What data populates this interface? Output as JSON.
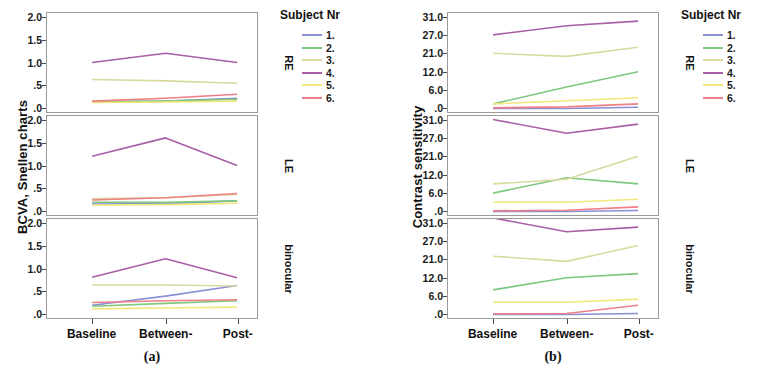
{
  "figure": {
    "panels": [
      {
        "id": "a",
        "caption": "(a)",
        "ylabel": "BCVA, Snellen charts",
        "legend_title": "Subject Nr"
      },
      {
        "id": "b",
        "caption": "(b)",
        "ylabel": "Contrast sensitivity",
        "legend_title": "Subject Nr"
      }
    ],
    "row_labels": [
      "RE",
      "LE",
      "binocular"
    ],
    "x_categories": [
      "Baseline",
      "Between-",
      "Post-"
    ],
    "legend_entries": [
      {
        "label": "1.",
        "color": "#8a8fd6"
      },
      {
        "label": "2.",
        "color": "#7ec87e"
      },
      {
        "label": "3.",
        "color": "#d9d9a0"
      },
      {
        "label": "4.",
        "color": "#a濾"
      },
      {
        "label": "5.",
        "color": "#f0e87a"
      },
      {
        "label": "6.",
        "color": "#ef7f86"
      }
    ]
  },
  "chart_data": [
    {
      "id": "a",
      "type": "line",
      "title": "(a)",
      "xlabel": "",
      "ylabel": "BCVA, Snellen charts",
      "x": [
        "Baseline",
        "Between-",
        "Post-"
      ],
      "yticks": [
        0,
        0.5,
        1.0,
        1.5,
        2.0
      ],
      "yticklabels": [
        ".0",
        ".5",
        "1.0",
        "1.5",
        "2.0"
      ],
      "ylim": [
        0,
        2.2
      ],
      "grid": false,
      "legend_position": "right",
      "legend_title": "Subject Nr",
      "facets": [
        {
          "name": "RE",
          "series": [
            {
              "name": "1.",
              "color": "#8a8fd6",
              "values": [
                0.14,
                0.16,
                0.22
              ]
            },
            {
              "name": "2.",
              "color": "#7ec87e",
              "values": [
                0.15,
                0.16,
                0.2
              ]
            },
            {
              "name": "3.",
              "color": "#d9d9a0",
              "values": [
                0.63,
                0.6,
                0.55
              ]
            },
            {
              "name": "4.",
              "color": "#a85fa8",
              "values": [
                1.0,
                1.2,
                1.0
              ]
            },
            {
              "name": "5.",
              "color": "#f0e87a",
              "values": [
                0.13,
                0.14,
                0.16
              ]
            },
            {
              "name": "6.",
              "color": "#ef7f86",
              "values": [
                0.16,
                0.22,
                0.31
              ]
            }
          ]
        },
        {
          "name": "LE",
          "series": [
            {
              "name": "1.",
              "color": "#8a8fd6",
              "values": [
                0.16,
                0.17,
                0.23
              ]
            },
            {
              "name": "2.",
              "color": "#7ec87e",
              "values": [
                0.2,
                0.2,
                0.23
              ]
            },
            {
              "name": "3.",
              "color": "#d9d9a0",
              "values": [
                0.28,
                0.3,
                0.37
              ]
            },
            {
              "name": "4.",
              "color": "#a85fa8",
              "values": [
                1.2,
                1.6,
                1.0
              ]
            },
            {
              "name": "5.",
              "color": "#f0e87a",
              "values": [
                0.14,
                0.15,
                0.18
              ]
            },
            {
              "name": "6.",
              "color": "#ef7f86",
              "values": [
                0.25,
                0.3,
                0.39
              ]
            }
          ]
        },
        {
          "name": "binocular",
          "series": [
            {
              "name": "1.",
              "color": "#8a8fd6",
              "values": [
                0.2,
                0.4,
                0.63
              ]
            },
            {
              "name": "2.",
              "color": "#7ec87e",
              "values": [
                0.18,
                0.24,
                0.3
              ]
            },
            {
              "name": "3.",
              "color": "#d9d9a0",
              "values": [
                0.64,
                0.64,
                0.62
              ]
            },
            {
              "name": "4.",
              "color": "#a85fa8",
              "values": [
                0.81,
                1.21,
                0.8
              ]
            },
            {
              "name": "5.",
              "color": "#f0e87a",
              "values": [
                0.12,
                0.14,
                0.16
              ]
            },
            {
              "name": "6.",
              "color": "#ef7f86",
              "values": [
                0.26,
                0.3,
                0.32
              ]
            }
          ]
        }
      ]
    },
    {
      "id": "b",
      "type": "line",
      "title": "(b)",
      "xlabel": "",
      "ylabel": "Contrast sensitivity",
      "x": [
        "Baseline",
        "Between-",
        "Post-"
      ],
      "yticks": [
        0,
        6,
        12,
        21,
        27,
        31
      ],
      "yticklabels": [
        ".0",
        "6.0",
        "12.0",
        "21.0",
        "27.0",
        "31.0"
      ],
      "ylim": [
        0,
        33
      ],
      "grid": false,
      "legend_position": "right",
      "legend_title": "Subject Nr",
      "facets": [
        {
          "name": "RE",
          "series": [
            {
              "name": "1.",
              "color": "#8a8fd6",
              "values": [
                0.0,
                0.0,
                0.4
              ]
            },
            {
              "name": "2.",
              "color": "#7ec87e",
              "values": [
                1.5,
                7.0,
                12.0
              ]
            },
            {
              "name": "3.",
              "color": "#d9d9a0",
              "values": [
                21.0,
                19.5,
                23.0
              ]
            },
            {
              "name": "4.",
              "color": "#a85fa8",
              "values": [
                27.0,
                29.0,
                30.0
              ]
            },
            {
              "name": "5.",
              "color": "#f0e87a",
              "values": [
                1.5,
                2.5,
                3.5
              ]
            },
            {
              "name": "6.",
              "color": "#ef7f86",
              "values": [
                0.2,
                0.5,
                1.5
              ]
            }
          ]
        },
        {
          "name": "LE",
          "series": [
            {
              "name": "1.",
              "color": "#8a8fd6",
              "values": [
                0.0,
                0.0,
                0.3
              ]
            },
            {
              "name": "2.",
              "color": "#7ec87e",
              "values": [
                6.0,
                11.0,
                9.0
              ]
            },
            {
              "name": "3.",
              "color": "#d9d9a0",
              "values": [
                9.0,
                10.5,
                21.0
              ]
            },
            {
              "name": "4.",
              "color": "#a85fa8",
              "values": [
                31.0,
                28.0,
                30.0
              ]
            },
            {
              "name": "5.",
              "color": "#f0e87a",
              "values": [
                3.0,
                3.0,
                4.0
              ]
            },
            {
              "name": "6.",
              "color": "#ef7f86",
              "values": [
                0.2,
                0.4,
                1.5
              ]
            }
          ]
        },
        {
          "name": "binocular",
          "series": [
            {
              "name": "1.",
              "color": "#8a8fd6",
              "values": [
                0.0,
                0.0,
                0.3
              ]
            },
            {
              "name": "2.",
              "color": "#7ec87e",
              "values": [
                8.0,
                12.0,
                14.0
              ]
            },
            {
              "name": "3.",
              "color": "#d9d9a0",
              "values": [
                22.0,
                20.0,
                25.5
              ]
            },
            {
              "name": "4.",
              "color": "#a85fa8",
              "values": [
                32.0,
                29.0,
                30.0
              ]
            },
            {
              "name": "5.",
              "color": "#f0e87a",
              "values": [
                4.0,
                4.0,
                5.0
              ]
            },
            {
              "name": "6.",
              "color": "#ef7f86",
              "values": [
                0.2,
                0.3,
                3.0
              ]
            }
          ]
        }
      ]
    }
  ]
}
